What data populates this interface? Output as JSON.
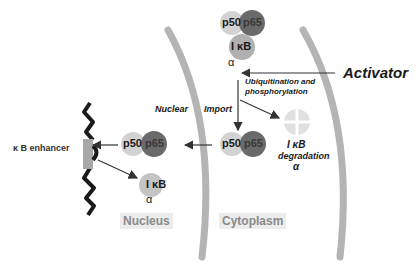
{
  "diagram": {
    "colors": {
      "p50": "#d2d2d2",
      "p65": "#6a6a6a",
      "ikb": "#b0b0b0",
      "membrane": "#b4b4b4",
      "region_bg": "#ececec",
      "region_text": "#8a8a8a",
      "degraded": "#e0e0e0"
    },
    "labels": {
      "activator": "Activator",
      "ubiquitination_line1": "Ubiquitination and",
      "ubiquitination_line2": "phosphorylation",
      "nuclear": "Nuclear",
      "import": "Import",
      "kb_enhancer": "κ B  enhancer",
      "degradation_ikb": "I κB",
      "degradation": "degradation",
      "degradation_alpha": "α",
      "nucleus": "Nucleus",
      "cytoplasm": "Cytoplasm"
    },
    "complexes": {
      "top": {
        "p50": "p50",
        "p65": "p65",
        "ikb": "I κB",
        "alpha": "α"
      },
      "cytoplasm_free": {
        "p50": "p50",
        "p65": "p65"
      },
      "nucleus_bound": {
        "p50": "p50",
        "p65": "p65"
      },
      "nucleus_ikb": {
        "ikb": "I κB",
        "alpha": "α"
      }
    }
  }
}
